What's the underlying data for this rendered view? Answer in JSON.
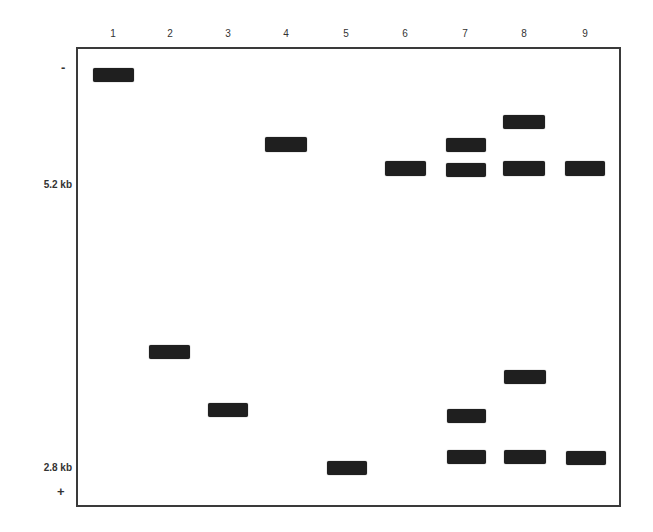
{
  "diagram": {
    "type": "gel-electrophoresis",
    "lanes": [
      {
        "label": "1",
        "x": 113
      },
      {
        "label": "2",
        "x": 170
      },
      {
        "label": "3",
        "x": 228
      },
      {
        "label": "4",
        "x": 286
      },
      {
        "label": "5",
        "x": 346
      },
      {
        "label": "6",
        "x": 405
      },
      {
        "label": "7",
        "x": 465
      },
      {
        "label": "8",
        "x": 524
      },
      {
        "label": "9",
        "x": 585
      }
    ],
    "markers": {
      "negative": "-",
      "positive": "+",
      "upper_size": "5.2 kb",
      "lower_size": "2.8 kb"
    },
    "bands": [
      {
        "lane": "1",
        "x": 93,
        "y": 68,
        "w": 41,
        "h": 14
      },
      {
        "lane": "2",
        "x": 149,
        "y": 345,
        "w": 41,
        "h": 14
      },
      {
        "lane": "3",
        "x": 208,
        "y": 403,
        "w": 40,
        "h": 14
      },
      {
        "lane": "4",
        "x": 265,
        "y": 137,
        "w": 42,
        "h": 15
      },
      {
        "lane": "5",
        "x": 327,
        "y": 461,
        "w": 40,
        "h": 14
      },
      {
        "lane": "6",
        "x": 385,
        "y": 161,
        "w": 41,
        "h": 15
      },
      {
        "lane": "7",
        "x": 446,
        "y": 138,
        "w": 40,
        "h": 14
      },
      {
        "lane": "7",
        "x": 446,
        "y": 163,
        "w": 40,
        "h": 14
      },
      {
        "lane": "7",
        "x": 447,
        "y": 409,
        "w": 39,
        "h": 14
      },
      {
        "lane": "7",
        "x": 447,
        "y": 450,
        "w": 39,
        "h": 14
      },
      {
        "lane": "8",
        "x": 503,
        "y": 115,
        "w": 42,
        "h": 14
      },
      {
        "lane": "8",
        "x": 503,
        "y": 161,
        "w": 42,
        "h": 15
      },
      {
        "lane": "8",
        "x": 504,
        "y": 370,
        "w": 42,
        "h": 14
      },
      {
        "lane": "8",
        "x": 504,
        "y": 450,
        "w": 42,
        "h": 14
      },
      {
        "lane": "9",
        "x": 565,
        "y": 161,
        "w": 40,
        "h": 15
      },
      {
        "lane": "9",
        "x": 566,
        "y": 451,
        "w": 40,
        "h": 14
      }
    ]
  }
}
